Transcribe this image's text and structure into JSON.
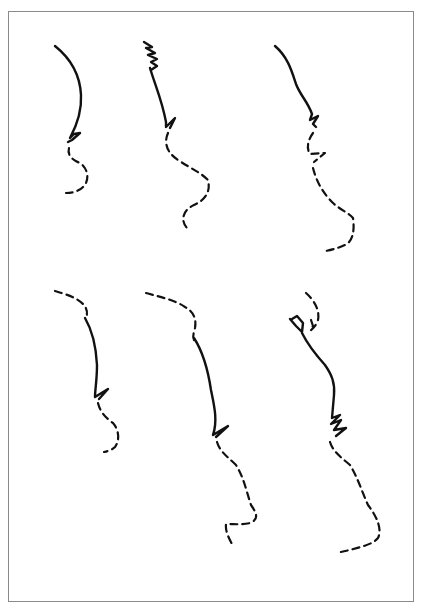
{
  "figure": {
    "frame_color": "#8a8a8a",
    "stroke_color": "#111111",
    "background": "#ffffff",
    "profiles": [
      {
        "id": "top-left",
        "row": 1,
        "col": 1,
        "style": "solid upper, dashed lower"
      },
      {
        "id": "top-middle",
        "row": 1,
        "col": 2,
        "style": "solid upper with hatched brow, dashed lower"
      },
      {
        "id": "top-right",
        "row": 1,
        "col": 3,
        "style": "solid upper, dashed lower"
      },
      {
        "id": "bottom-left",
        "row": 2,
        "col": 1,
        "style": "dashed brow, solid nose, dashed lower"
      },
      {
        "id": "bottom-middle",
        "row": 2,
        "col": 2,
        "style": "dashed brow, solid nose, dashed lower"
      },
      {
        "id": "bottom-right",
        "row": 2,
        "col": 3,
        "style": "dashed brow loop, solid nose, dashed lower"
      }
    ]
  }
}
